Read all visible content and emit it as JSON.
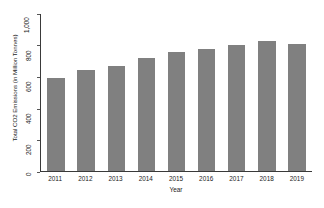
{
  "chart_data": {
    "type": "bar",
    "title": "",
    "xlabel": "Year",
    "ylabel": "Total CO2 Emissions (in Million Tonnes)",
    "categories": [
      "2011",
      "2012",
      "2013",
      "2014",
      "2015",
      "2016",
      "2017",
      "2018",
      "2019"
    ],
    "values": [
      595,
      645,
      670,
      720,
      755,
      780,
      805,
      825,
      810
    ],
    "series": [
      {
        "name": "Total CO2 Emissions",
        "values": [
          595,
          645,
          670,
          720,
          755,
          780,
          805,
          825,
          810
        ]
      }
    ],
    "ylim": [
      0,
      1000
    ],
    "yticks": [
      0,
      200,
      400,
      600,
      800,
      1000
    ],
    "ytick_labels": [
      "0",
      "200",
      "400",
      "600",
      "800",
      "1,000"
    ],
    "grid": false,
    "legend": "none",
    "bar_color": "#808080",
    "axis_color": "#3a3a3a",
    "background": "#ffffff"
  }
}
